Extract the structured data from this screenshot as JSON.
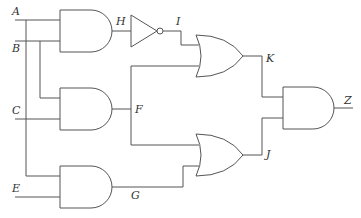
{
  "diagram": {
    "type": "logic-circuit",
    "inputs": [
      "A",
      "B",
      "C",
      "E"
    ],
    "output": "Z",
    "labels": {
      "A": "A",
      "B": "B",
      "C": "C",
      "E": "E",
      "H": "H",
      "I": "I",
      "F": "F",
      "G": "G",
      "K": "K",
      "J": "J",
      "Z": "Z"
    },
    "gates": [
      {
        "id": "and1",
        "type": "AND",
        "inputs": [
          "A",
          "B"
        ],
        "output": "H"
      },
      {
        "id": "not1",
        "type": "NOT",
        "inputs": [
          "H"
        ],
        "output": "I"
      },
      {
        "id": "and2",
        "type": "AND",
        "inputs": [
          "B",
          "C"
        ],
        "output": "F"
      },
      {
        "id": "and3",
        "type": "AND",
        "inputs": [
          "A",
          "E"
        ],
        "output": "G"
      },
      {
        "id": "or1",
        "type": "OR",
        "inputs": [
          "I",
          "F"
        ],
        "output": "K"
      },
      {
        "id": "or2",
        "type": "OR",
        "inputs": [
          "F",
          "G"
        ],
        "output": "J"
      },
      {
        "id": "and4",
        "type": "AND",
        "inputs": [
          "K",
          "J"
        ],
        "output": "Z"
      }
    ]
  }
}
